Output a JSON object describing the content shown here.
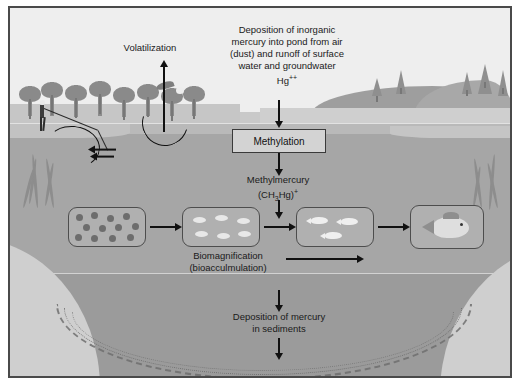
{
  "diagram": {
    "frame_border_color": "#4a4a4a",
    "background_color": "#d8d8d8"
  },
  "labels": {
    "volatilization": "Volatilization",
    "deposition_top": "Deposition of inorganic mercury into pond from air (dust) and runoff of surface water and groundwater",
    "deposition_line1": "Deposition of inorganic",
    "deposition_line2": "mercury into pond from air",
    "deposition_line3": "(dust) and runoff of surface",
    "deposition_line4": "water and groundwater",
    "mercury_ion": "Hg",
    "mercury_ion_charge": "++",
    "methylation": "Methylation",
    "methylmercury_name": "Methylmercury",
    "methylmercury_formula_pre": "(CH",
    "methylmercury_formula_sub": "3",
    "methylmercury_formula_mid": "Hg)",
    "methylmercury_formula_sup": "+",
    "biomagnification_line1": "Biomagnification",
    "biomagnification_line2": "(bioacculmulation)",
    "sediment_line1": "Deposition of mercury",
    "sediment_line2": "in sediments"
  },
  "food_chain": {
    "steps": [
      {
        "name": "plankton-box",
        "organism": "plankton",
        "count": 12
      },
      {
        "name": "larvae-box",
        "organism": "aquatic-invertebrates",
        "count": 6
      },
      {
        "name": "small-fish-box",
        "organism": "small-fish",
        "count": 3
      },
      {
        "name": "large-fish-box",
        "organism": "large-fish",
        "count": 1
      }
    ]
  },
  "scenery": {
    "sky": "sky",
    "hills": "rolling-hills",
    "trees_left": "deciduous-trees",
    "trees_right": "conifer-trees",
    "bird": "flying-bird",
    "person": "person-fishing",
    "water_surface": "pond-surface",
    "sediment_layer": "pond-sediment"
  }
}
